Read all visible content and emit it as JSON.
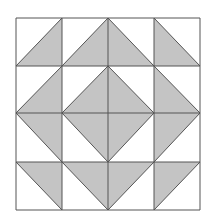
{
  "diagram": {
    "type": "quilt-block-pattern",
    "grid": {
      "rows": 4,
      "cols": 4
    },
    "colors": {
      "fill": "#c4c4c4",
      "stroke": "#555555",
      "background": "#ffffff"
    },
    "gridlines_x": [
      16,
      62,
      108,
      154,
      200
    ],
    "gridlines_y": [
      18,
      66,
      113,
      162,
      210
    ],
    "shaded_triangles": [
      {
        "row": 0,
        "col": 0,
        "corners": [
          "TR",
          "BR",
          "BL"
        ]
      },
      {
        "row": 0,
        "col": 1,
        "corners": [
          "TR",
          "BR",
          "BL"
        ]
      },
      {
        "row": 0,
        "col": 2,
        "corners": [
          "TL",
          "BL",
          "BR"
        ]
      },
      {
        "row": 0,
        "col": 3,
        "corners": [
          "TL",
          "BL",
          "BR"
        ]
      },
      {
        "row": 1,
        "col": 0,
        "corners": [
          "TR",
          "BR",
          "BL"
        ]
      },
      {
        "row": 1,
        "col": 1,
        "corners": [
          "TR",
          "BR",
          "BL"
        ]
      },
      {
        "row": 1,
        "col": 2,
        "corners": [
          "TL",
          "BL",
          "BR"
        ]
      },
      {
        "row": 1,
        "col": 3,
        "corners": [
          "TL",
          "BL",
          "BR"
        ]
      },
      {
        "row": 2,
        "col": 0,
        "corners": [
          "TL",
          "TR",
          "BR"
        ]
      },
      {
        "row": 2,
        "col": 1,
        "corners": [
          "TL",
          "TR",
          "BR"
        ]
      },
      {
        "row": 2,
        "col": 2,
        "corners": [
          "TL",
          "TR",
          "BL"
        ]
      },
      {
        "row": 2,
        "col": 3,
        "corners": [
          "TL",
          "TR",
          "BL"
        ]
      },
      {
        "row": 3,
        "col": 0,
        "corners": [
          "TL",
          "TR",
          "BR"
        ]
      },
      {
        "row": 3,
        "col": 1,
        "corners": [
          "TL",
          "TR",
          "BR"
        ]
      },
      {
        "row": 3,
        "col": 2,
        "corners": [
          "TL",
          "TR",
          "BL"
        ]
      },
      {
        "row": 3,
        "col": 3,
        "corners": [
          "TL",
          "TR",
          "BL"
        ]
      }
    ]
  }
}
